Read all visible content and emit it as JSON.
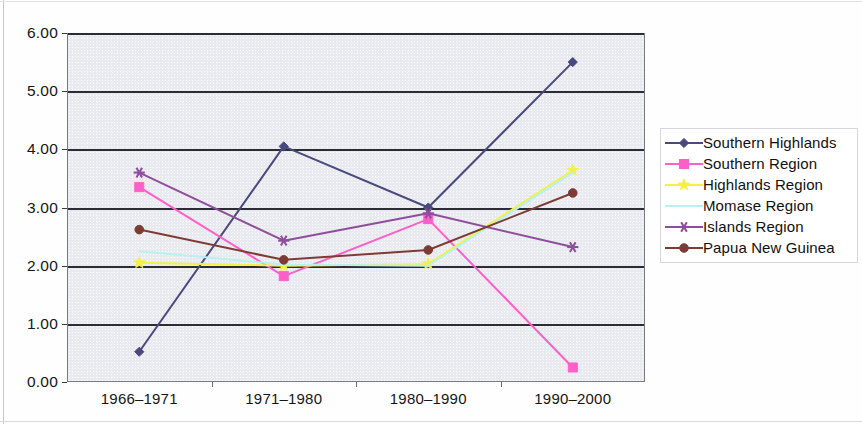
{
  "chart_data": {
    "type": "line",
    "title": "",
    "subtitle": "",
    "xlabel": "",
    "ylabel": "",
    "categories": [
      "1966–1971",
      "1971–1980",
      "1980–1990",
      "1990–2000"
    ],
    "ylim": [
      0,
      6
    ],
    "ytick_labels": [
      "0.00",
      "1.00",
      "2.00",
      "3.00",
      "4.00",
      "5.00",
      "6.00"
    ],
    "ytick_values": [
      0,
      1,
      2,
      3,
      4,
      5,
      6
    ],
    "grid": "horizontal",
    "legend_position": "right",
    "series": [
      {
        "name": "Southern Highlands",
        "color": "#49497e",
        "marker": "diamond",
        "values": [
          0.52,
          4.05,
          3.0,
          5.5
        ]
      },
      {
        "name": "Southern Region",
        "color": "#ff5fc8",
        "marker": "square",
        "values": [
          3.35,
          1.82,
          2.8,
          0.25
        ]
      },
      {
        "name": "Highlands Region",
        "color": "#f5f045",
        "marker": "star",
        "values": [
          2.05,
          2.0,
          2.03,
          3.64
        ]
      },
      {
        "name": "Momase Region",
        "color": "#b6f2ee",
        "marker": "none",
        "values": [
          2.25,
          2.02,
          2.0,
          3.6
        ]
      },
      {
        "name": "Islands Region",
        "color": "#8f4e9c",
        "marker": "asterisk",
        "values": [
          3.6,
          2.43,
          2.9,
          2.32
        ]
      },
      {
        "name": "Papua New Guinea",
        "color": "#7d3b34",
        "marker": "circle",
        "values": [
          2.62,
          2.1,
          2.27,
          3.25
        ]
      }
    ]
  },
  "legend": {
    "items": [
      {
        "label": "Southern Highlands"
      },
      {
        "label": "Southern Region"
      },
      {
        "label": "Highlands Region"
      },
      {
        "label": "Momase Region"
      },
      {
        "label": "Islands Region"
      },
      {
        "label": "Papua New Guinea"
      }
    ]
  }
}
